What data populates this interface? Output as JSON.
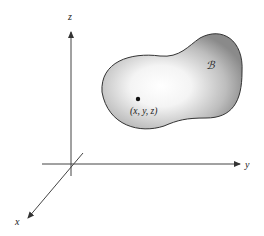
{
  "diagram": {
    "axes": {
      "x_label": "x",
      "y_label": "y",
      "z_label": "z"
    },
    "region": {
      "label": "ℬ",
      "fill_center": "#ffffff",
      "fill_edge": "#8a8a8a",
      "outline": "#333333"
    },
    "point": {
      "label": "(x, y, z)"
    },
    "colors": {
      "axis": "#444444",
      "background": "#ffffff"
    }
  }
}
